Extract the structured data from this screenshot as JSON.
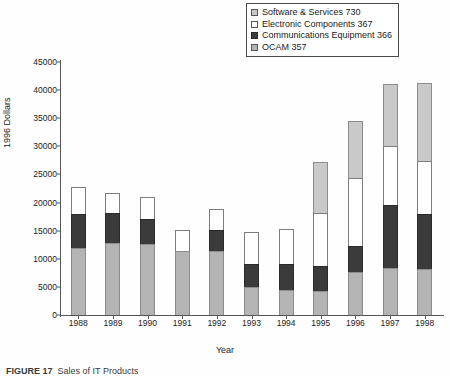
{
  "figure": {
    "caption_label": "FIGURE 17",
    "caption_text": "Sales of IT Products"
  },
  "legend": {
    "position": "top-right",
    "items": [
      {
        "label": "Software & Services 730",
        "name": "software-services",
        "swatch": "light-gray",
        "color": "#c9c9c9"
      },
      {
        "label": "Electronic Components 367",
        "name": "electronic-components",
        "swatch": "white",
        "color": "#ffffff"
      },
      {
        "label": "Communications Equipment 366",
        "name": "communications-equipment",
        "swatch": "dark-gray",
        "color": "#3b3b3b"
      },
      {
        "label": "OCAM 357",
        "name": "ocam",
        "swatch": "medium-gray",
        "color": "#b4b4b4"
      }
    ]
  },
  "axes": {
    "ylabel": "1996 Dollars",
    "xlabel": "Year",
    "yticks": [
      "0",
      "5000",
      "10000",
      "15000",
      "20000",
      "25000",
      "30000",
      "35000",
      "40000",
      "45000"
    ],
    "ymin": 0,
    "ymax": 45000,
    "ystep": 5000
  },
  "chart_data": {
    "type": "bar",
    "subtype": "stacked-vertical",
    "title": "",
    "xlabel": "Year",
    "ylabel": "1996 Dollars",
    "ylim": [
      0,
      45000
    ],
    "ystep": 5000,
    "grid": false,
    "legend_position": "top-right",
    "categories": [
      "1988",
      "1989",
      "1990",
      "1991",
      "1992",
      "1993",
      "1994",
      "1995",
      "1996",
      "1997",
      "1998"
    ],
    "stack_order_bottom_to_top": [
      "OCAM 357",
      "Communications Equipment 366",
      "Electronic Components 367",
      "Software & Services 730"
    ],
    "series": [
      {
        "name": "OCAM 357",
        "color": "#b4b4b4",
        "values": [
          12000,
          12800,
          12600,
          11300,
          11300,
          5000,
          4400,
          4200,
          7700,
          8300,
          8200
        ]
      },
      {
        "name": "Communications Equipment 366",
        "color": "#3b3b3b",
        "values": [
          5900,
          5300,
          4500,
          0,
          3900,
          4100,
          4700,
          4500,
          4500,
          11200,
          9700
        ]
      },
      {
        "name": "Electronic Components 367",
        "color": "#ffffff",
        "values": [
          4800,
          3600,
          3900,
          3800,
          3600,
          5700,
          6200,
          9500,
          12200,
          10500,
          9500
        ]
      },
      {
        "name": "Software & Services 730",
        "color": "#c9c9c9",
        "values": [
          0,
          0,
          0,
          0,
          0,
          0,
          0,
          9100,
          10200,
          11100,
          13900
        ]
      }
    ],
    "totals": [
      22700,
      21700,
      21000,
      15100,
      18800,
      14800,
      15300,
      27300,
      34600,
      41100,
      41300
    ]
  }
}
